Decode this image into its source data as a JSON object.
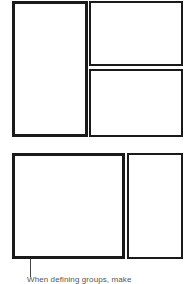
{
  "diagrams": [
    {
      "name": "layout-three-panes",
      "panes": [
        "left-tall",
        "right-top",
        "right-bottom"
      ]
    },
    {
      "name": "layout-two-panes",
      "panes": [
        "left-wide",
        "right-narrow"
      ]
    }
  ],
  "caption": {
    "text": "When defining groups, make"
  },
  "colors": {
    "border": "#1a1a1a",
    "background": "#ffffff",
    "caption": "#555555"
  }
}
